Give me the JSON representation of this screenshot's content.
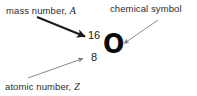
{
  "figure": {
    "background_color": "#ffffff",
    "text_color": "#2b2b2b"
  },
  "labels": {
    "mass_number": {
      "text_prefix": "mass number, ",
      "variable": "A",
      "full": "mass number, A"
    },
    "chemical_symbol": {
      "full": "chemical symbol"
    },
    "atomic_number": {
      "text_prefix": "atomic number, ",
      "variable": "Z",
      "full": "atomic number, Z"
    }
  },
  "notation": {
    "mass_number_value": "16",
    "atomic_number_value": "8",
    "element_symbol": "O"
  },
  "arrows": [
    {
      "name": "mass-number-arrow",
      "style": "thick-dark",
      "color": "#1a1a1a",
      "from": [
        37,
        17
      ],
      "to": [
        88,
        38
      ]
    },
    {
      "name": "chemical-symbol-arrow",
      "style": "thin-gray",
      "color": "#8a8a8a",
      "from": [
        158,
        20
      ],
      "to": [
        121,
        45
      ]
    },
    {
      "name": "atomic-number-arrow",
      "style": "thin-gray",
      "color": "#8a8a8a",
      "from": [
        28,
        78
      ],
      "to": [
        86,
        57
      ]
    }
  ]
}
